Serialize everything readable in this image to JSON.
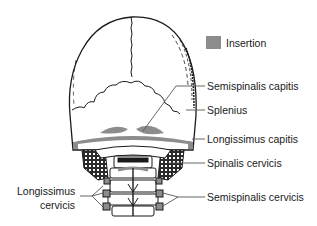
{
  "figure": {
    "legend": {
      "swatch_color": "#8c8c8c",
      "label": "Insertion"
    },
    "labels_right": [
      {
        "text": "Semispinalis capitis"
      },
      {
        "text": "Splenius"
      },
      {
        "text": "Longissimus capitis"
      },
      {
        "text": "Spinalis cervicis"
      },
      {
        "text": "Semispinalis cervicis"
      }
    ],
    "labels_left": [
      {
        "line1": "Longissimus",
        "line2": "cervicis"
      }
    ],
    "colors": {
      "ink": "#1a1a1a",
      "insertion": "#8c8c8c",
      "leader": "#555555",
      "background": "#ffffff"
    }
  }
}
